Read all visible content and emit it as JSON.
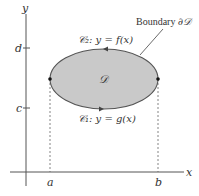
{
  "diagram": {
    "axes": {
      "x_label": "x",
      "y_label": "y",
      "x_ticks": [
        {
          "label": "a",
          "x": 50
        },
        {
          "label": "b",
          "x": 158
        }
      ],
      "y_ticks": [
        {
          "label": "d",
          "y": 48
        },
        {
          "label": "c",
          "y": 108
        }
      ]
    },
    "region": {
      "label": "𝒟",
      "fill": "#c9c9c9",
      "stroke": "#555555"
    },
    "curves": {
      "upper": {
        "name": "C₂",
        "equation": "y = f(x)",
        "label": "𝒞₂: y = f(x)"
      },
      "lower": {
        "name": "C₁",
        "equation": "y = g(x)",
        "label": "𝒞₁: y = g(x)"
      }
    },
    "boundary_label": "Boundary ∂𝒟",
    "boundary_label_prefix": "Boundary ",
    "boundary_label_symbol": "∂𝒟"
  }
}
